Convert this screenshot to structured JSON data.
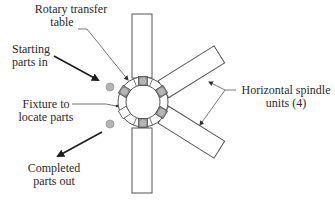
{
  "diagram": {
    "type": "rotary indexing machine schematic",
    "labels": {
      "rotary_table_line1": "Rotary transfer",
      "rotary_table_line2": "table",
      "starting_line1": "Starting",
      "starting_line2": "parts in",
      "fixture_line1": "Fixture to",
      "fixture_line2": "locate parts",
      "completed_line1": "Completed",
      "completed_line2": "parts out",
      "spindle_line1": "Horizontal spindle",
      "spindle_line2": "units (4)"
    },
    "components": {
      "rotary_table": {
        "fixtures": 8,
        "part_positions_filled": 6
      },
      "spindle_units": 4
    },
    "colors": {
      "line": "#555555",
      "part_fill": "#b5b5b5",
      "fixture_fill": "#8c8c8c",
      "arrow": "#1e1e1e",
      "text": "#2a2a2a"
    }
  }
}
